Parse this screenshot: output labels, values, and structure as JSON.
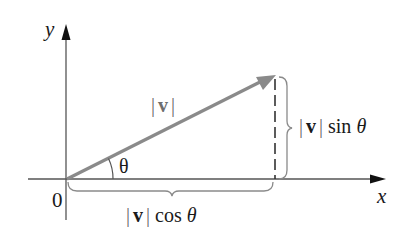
{
  "diagram": {
    "axes": {
      "x_label": "x",
      "y_label": "y",
      "origin_label": "0"
    },
    "vector": {
      "label_bar_left": "|",
      "label_symbol": "v",
      "label_bar_right": "|",
      "color": "#8a8a8a"
    },
    "angle": {
      "label": "θ"
    },
    "vertical_component": {
      "bar_left": "|",
      "symbol": "v",
      "bar_right": "|",
      "func": "sin",
      "angle": "θ"
    },
    "horizontal_component": {
      "bar_left": "|",
      "symbol": "v",
      "bar_right": "|",
      "func": "cos",
      "angle": "θ"
    },
    "colors": {
      "axis": "#555555",
      "vector": "#8a8a8a",
      "brace": "#8a8a8a",
      "dashed": "#333333",
      "text": "#1a1a1a"
    }
  }
}
